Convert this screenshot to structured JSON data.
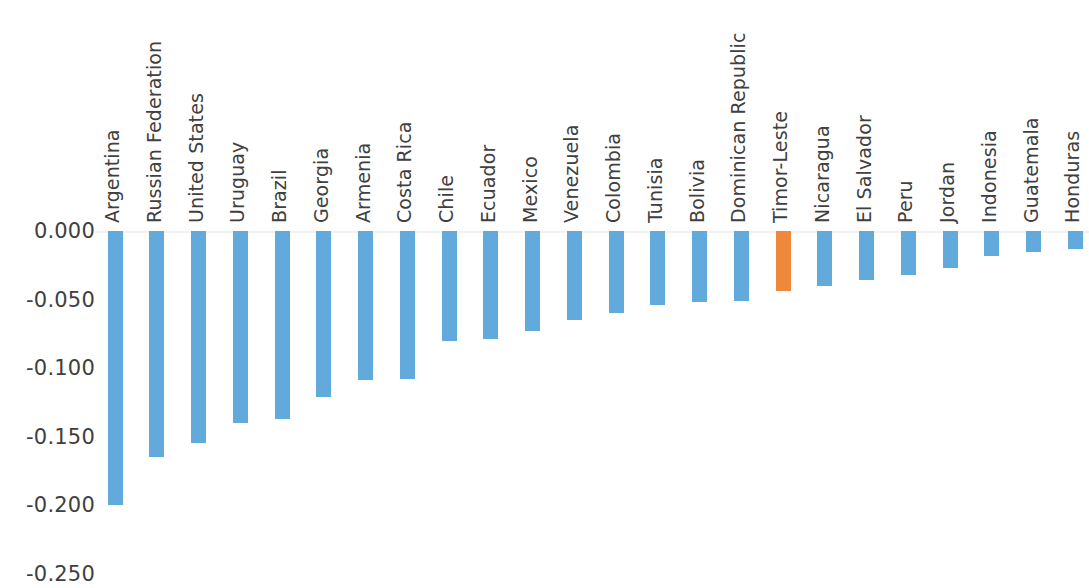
{
  "chart_data": {
    "type": "bar",
    "title": "",
    "subtitle": "",
    "xlabel": "",
    "ylabel": "",
    "grid": false,
    "legend": "none",
    "orientation": "vertical",
    "ylim": [
      -0.25,
      0.0
    ],
    "ytick_labels": [
      "0.000",
      "-0.050",
      "-0.100",
      "-0.150",
      "-0.200",
      "-0.250"
    ],
    "ytick_values": [
      0.0,
      -0.05,
      -0.1,
      -0.15,
      -0.2,
      -0.25
    ],
    "bar_color": "#62aadc",
    "highlight_color": "#f0883c",
    "highlight_category": "Timor-Leste",
    "axis_text_color": "#404040",
    "baseline_color": "#f2f2f2",
    "categories": [
      "Argentina",
      "Russian Federation",
      "United States",
      "Uruguay",
      "Brazil",
      "Georgia",
      "Armenia",
      "Costa Rica",
      "Chile",
      "Ecuador",
      "Mexico",
      "Venezuela",
      "Colombia",
      "Tunisia",
      "Bolivia",
      "Dominican Republic",
      "Timor-Leste",
      "Nicaragua",
      "El Salvador",
      "Peru",
      "Jordan",
      "Indonesia",
      "Guatemala",
      "Honduras"
    ],
    "values": [
      -0.2,
      -0.165,
      -0.155,
      -0.14,
      -0.137,
      -0.121,
      -0.109,
      -0.108,
      -0.08,
      -0.079,
      -0.073,
      -0.065,
      -0.06,
      -0.054,
      -0.052,
      -0.051,
      -0.044,
      -0.04,
      -0.036,
      -0.032,
      -0.027,
      -0.018,
      -0.015,
      -0.013
    ]
  }
}
